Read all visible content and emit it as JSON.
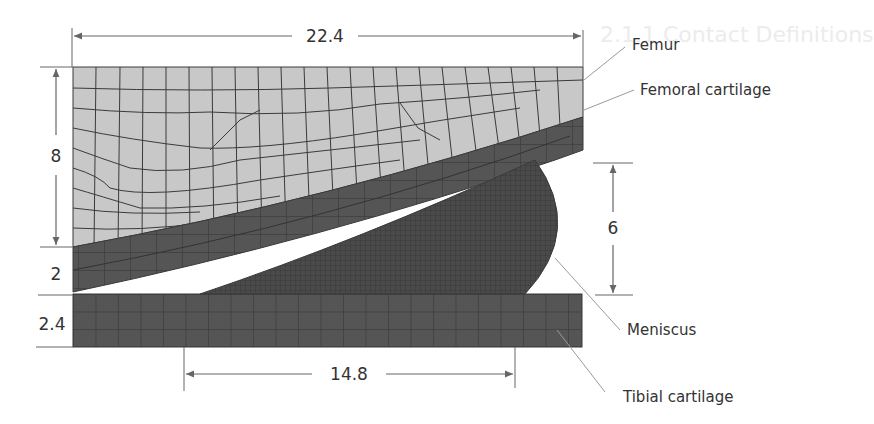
{
  "figure": {
    "type": "finite-element mesh schematic (knee joint, 2D)",
    "background_ghost_text": [
      "2.1.1 Contact Definitions"
    ],
    "colors": {
      "femur": "#c8c8c8",
      "cartilage": "#555555",
      "meniscus": "#4a4a4a",
      "mesh_line": "#3a3a3a",
      "dimension_line": "#666666",
      "leader_line": "#9a9a9a",
      "text": "#333333"
    },
    "dimensions": {
      "femur_width": "22.4",
      "femur_height": "8",
      "femoral_cartilage_thickness": "2",
      "tibial_cartilage_thickness": "2.4",
      "meniscus_height": "6",
      "meniscus_width": "14.8"
    },
    "callouts": {
      "femur": "Femur",
      "femoral_cartilage": "Femoral cartilage",
      "meniscus": "Meniscus",
      "tibial_cartilage": "Tibial cartilage"
    }
  }
}
